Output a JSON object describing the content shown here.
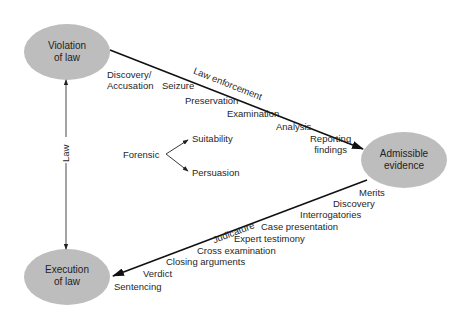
{
  "nodes": {
    "violation": {
      "line1": "Violation",
      "line2": "of law"
    },
    "admissible": {
      "line1": "Admissible",
      "line2": "evidence"
    },
    "execution": {
      "line1": "Execution",
      "line2": "of law"
    }
  },
  "edges": {
    "law": {
      "label": "Law"
    },
    "law_enforcement": {
      "label": "Law enforcement"
    },
    "judicature": {
      "label": "Judicature"
    }
  },
  "law_enforcement_steps": {
    "discovery1": "Discovery/",
    "discovery2": "Accusation",
    "seizure": "Seizure",
    "preservation": "Preservation",
    "examination": "Examination",
    "analysis": "Analysis",
    "reporting1": "Reporting",
    "reporting2": "findings"
  },
  "judicature_steps": {
    "merits": "Merits",
    "discovery": "Discovery",
    "interrogatories": "Interrogatories",
    "case_presentation": "Case presentation",
    "expert_testimony": "Expert testimony",
    "cross_examination": "Cross examination",
    "closing_arguments": "Closing arguments",
    "verdict": "Verdict",
    "sentencing": "Sentencing"
  },
  "forensic": {
    "label": "Forensic",
    "suitability": "Suitability",
    "persuasion": "Persuasion"
  },
  "colors": {
    "node_fill": "#bdbdbd",
    "line": "#1a1a1a"
  }
}
